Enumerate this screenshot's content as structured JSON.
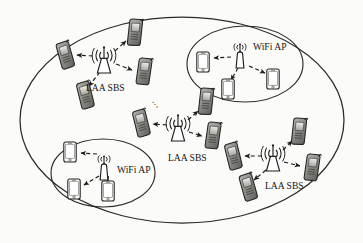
{
  "figure": {
    "type": "network-topology-diagram",
    "background_color": "#fbfbf9",
    "stroke_color": "#1b1b1b",
    "width": 363,
    "height": 243
  },
  "macro_cell": {
    "name": "macro-cell-boundary",
    "shape": "ellipse",
    "cx": 182,
    "cy": 120,
    "rx": 162,
    "ry": 103,
    "stroke": "#2a2a2a"
  },
  "labels": {
    "laa_sbs": "LAA SBS",
    "wifi_ap": "WiFi AP",
    "ellipsis": "⋯"
  },
  "base_stations": [
    {
      "id": "laa-sbs-top-left",
      "label": "LAA SBS",
      "type": "laa-sbs",
      "x": 104,
      "y": 60,
      "label_x": 86,
      "label_y": 88,
      "users": [
        {
          "id": "ue-tl-1",
          "x": 65,
          "y": 57,
          "rot": -12,
          "dir": "left"
        },
        {
          "id": "ue-tl-2",
          "x": 134,
          "y": 34,
          "rot": 10,
          "dir": "up-right"
        },
        {
          "id": "ue-tl-3",
          "x": 143,
          "y": 73,
          "rot": 12,
          "dir": "down-right"
        },
        {
          "id": "ue-tl-4",
          "x": 85,
          "y": 97,
          "rot": -10,
          "dir": "down-left"
        }
      ]
    },
    {
      "id": "laa-sbs-center",
      "label": "LAA SBS",
      "type": "laa-sbs",
      "x": 178,
      "y": 128,
      "label_x": 168,
      "label_y": 158,
      "users": [
        {
          "id": "ue-c-1",
          "x": 141,
          "y": 125,
          "rot": -10,
          "dir": "left"
        },
        {
          "id": "ue-c-2",
          "x": 205,
          "y": 103,
          "rot": 10,
          "dir": "up-right"
        },
        {
          "id": "ue-c-3",
          "x": 212,
          "y": 137,
          "rot": 12,
          "dir": "down-right"
        }
      ]
    },
    {
      "id": "laa-sbs-bottom-right",
      "label": "LAA SBS",
      "type": "laa-sbs",
      "x": 273,
      "y": 158,
      "label_x": 265,
      "label_y": 186,
      "users": [
        {
          "id": "ue-br-1",
          "x": 233,
          "y": 158,
          "rot": -10,
          "dir": "left"
        },
        {
          "id": "ue-br-2",
          "x": 298,
          "y": 133,
          "rot": 10,
          "dir": "up-right"
        },
        {
          "id": "ue-br-3",
          "x": 311,
          "y": 169,
          "rot": 12,
          "dir": "down-right"
        },
        {
          "id": "ue-br-4",
          "x": 248,
          "y": 189,
          "rot": -12,
          "dir": "down-left"
        }
      ]
    }
  ],
  "access_points": [
    {
      "id": "wifi-ap-top-right",
      "label": "WiFi AP",
      "type": "wifi-ap",
      "x": 240,
      "y": 56,
      "label_x": 253,
      "label_y": 47,
      "cell": {
        "cx": 245,
        "cy": 64,
        "rx": 58,
        "ry": 38
      },
      "clients": [
        {
          "id": "sta-tr-1",
          "x": 203,
          "y": 62,
          "dir": "left"
        },
        {
          "id": "sta-tr-2",
          "x": 228,
          "y": 89,
          "dir": "down-left"
        },
        {
          "id": "sta-tr-3",
          "x": 273,
          "y": 79,
          "dir": "down-right"
        }
      ]
    },
    {
      "id": "wifi-ap-bottom-left",
      "label": "WiFi AP",
      "type": "wifi-ap",
      "x": 104,
      "y": 168,
      "label_x": 117,
      "label_y": 170,
      "cell": {
        "cx": 103,
        "cy": 173,
        "rx": 52,
        "ry": 34
      },
      "clients": [
        {
          "id": "sta-bl-1",
          "x": 70,
          "y": 152,
          "dir": "left"
        },
        {
          "id": "sta-bl-2",
          "x": 74,
          "y": 189,
          "dir": "down-left"
        },
        {
          "id": "sta-bl-3",
          "x": 108,
          "y": 191,
          "dir": "down-right"
        }
      ]
    }
  ],
  "ellipsis_marker": {
    "id": "cluster-ellipsis",
    "x": 155,
    "y": 99
  }
}
